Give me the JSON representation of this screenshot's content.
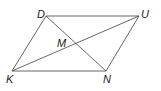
{
  "diagram": {
    "type": "parallelogram",
    "vertices": {
      "D": {
        "label": "D",
        "x": 46,
        "y": 16
      },
      "U": {
        "label": "U",
        "x": 139,
        "y": 16
      },
      "N": {
        "label": "N",
        "x": 106,
        "y": 71
      },
      "K": {
        "label": "K",
        "x": 12,
        "y": 71
      }
    },
    "intersection": {
      "label": "M",
      "x": 77,
      "y": 44
    },
    "sides": [
      "DU",
      "UN",
      "NK",
      "KD"
    ],
    "diagonals": [
      "DN",
      "KU"
    ],
    "line_color": "#555555"
  }
}
